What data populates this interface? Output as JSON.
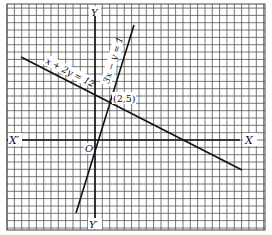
{
  "figure": {
    "axes": {
      "x_positive_label": "X",
      "x_negative_label": "X′",
      "y_positive_label": "Y",
      "y_negative_label": "Y′",
      "origin_label": "O"
    },
    "lines": [
      {
        "equation_label": "x + 2y = 12",
        "color": "#111111"
      },
      {
        "equation_label": "3x − y = 1",
        "color": "#111111"
      }
    ],
    "intersection": {
      "label": "(2,5)",
      "x": 2,
      "y": 5
    },
    "grid": {
      "color": "#555555",
      "background": "#ffffff"
    }
  },
  "chart_data": {
    "type": "line",
    "title": "",
    "xlabel": "X",
    "ylabel": "Y",
    "grid": true,
    "xlim": [
      -12,
      23
    ],
    "ylim": [
      -12,
      18
    ],
    "series": [
      {
        "name": "x + 2y = 12",
        "points": [
          [
            -10,
            11
          ],
          [
            20,
            -4
          ]
        ]
      },
      {
        "name": "3x − y = 1",
        "points": [
          [
            -3,
            -10
          ],
          [
            5,
            14
          ]
        ]
      }
    ],
    "annotations": [
      {
        "text": "(2,5)",
        "x": 2,
        "y": 5
      }
    ]
  }
}
